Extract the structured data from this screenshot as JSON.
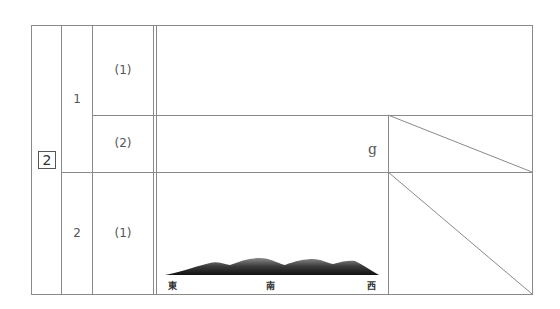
{
  "question": {
    "number": "2",
    "parts": [
      {
        "label": "1",
        "subparts": [
          {
            "label": "(1)"
          },
          {
            "label": "(2)",
            "unit": "g"
          }
        ]
      },
      {
        "label": "2",
        "subparts": [
          {
            "label": "(1)"
          }
        ]
      }
    ]
  },
  "mountain_figure": {
    "directions": {
      "east": "東",
      "south": "南",
      "west": "西"
    }
  }
}
